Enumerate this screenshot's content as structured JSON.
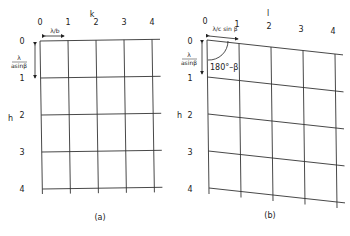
{
  "panels": [
    {
      "id": "a",
      "caption": "(a)",
      "column_axis_label": "k",
      "row_axis_label": "h",
      "column_labels": [
        "0",
        "1",
        "2",
        "3",
        "4"
      ],
      "row_labels": [
        "0",
        "1",
        "2",
        "3",
        "4"
      ],
      "horizontal_spacing_label": "λ/b",
      "vertical_spacing_label_num": "λ",
      "vertical_spacing_label_den": "asinβ",
      "angle_label": ""
    },
    {
      "id": "b",
      "caption": "(b)",
      "column_axis_label": "l",
      "row_axis_label": "h",
      "column_labels": [
        "0",
        "1",
        "2",
        "3",
        "4"
      ],
      "row_labels": [
        "0",
        "1",
        "2",
        "3",
        "4"
      ],
      "horizontal_spacing_label": "λ/c sin β",
      "vertical_spacing_label_num": "λ",
      "vertical_spacing_label_den": "asinβ",
      "angle_label": "180°–β"
    }
  ]
}
